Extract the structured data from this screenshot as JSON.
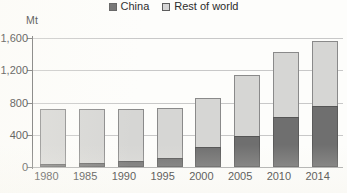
{
  "unit_label": "Mt",
  "legend": {
    "position": "top-center",
    "entries": [
      {
        "label": "China",
        "color": "#6f6f6f",
        "icon": "legend-swatch-icon"
      },
      {
        "label": "Rest of world",
        "color": "#d6d6d4",
        "icon": "legend-swatch-icon"
      }
    ]
  },
  "yaxis": {
    "ticks": [
      "0",
      "400",
      "800",
      "1,200",
      "1,600"
    ],
    "values": [
      0,
      400,
      800,
      1200,
      1600
    ]
  },
  "chart_data": {
    "type": "bar",
    "subtype": "stacked",
    "title": "",
    "subtitle": "",
    "xlabel": "",
    "ylabel": "Mt",
    "unit": "Mt",
    "ylim": [
      0,
      1600
    ],
    "ytick_values": [
      0,
      400,
      800,
      1200,
      1600
    ],
    "ytick_labels": [
      "0",
      "400",
      "800",
      "1,200",
      "1,600"
    ],
    "grid": true,
    "grid_axis": "y",
    "legend": [
      "China",
      "Rest of world"
    ],
    "legend_position": "top-center",
    "categories": [
      "1980",
      "1985",
      "1990",
      "1995",
      "2000",
      "2005",
      "2010",
      "2014"
    ],
    "series": [
      {
        "name": "China",
        "color": "#6f6f6f",
        "values": [
          40,
          50,
          70,
          110,
          250,
          380,
          620,
          760
        ]
      },
      {
        "name": "Rest of world",
        "color": "#d6d6d4",
        "values": [
          675,
          665,
          650,
          620,
          610,
          760,
          810,
          800
        ]
      }
    ],
    "totals": [
      715,
      715,
      720,
      730,
      860,
      1140,
      1430,
      1560
    ],
    "annotations": []
  }
}
